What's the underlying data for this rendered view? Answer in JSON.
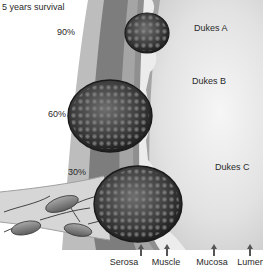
{
  "diagram": {
    "title": "5 years survival",
    "survival_labels": [
      {
        "value": "90%",
        "stage": "Dukes A"
      },
      {
        "value": "60%",
        "stage": "Dukes B"
      },
      {
        "value": "30%",
        "stage": "Dukes C"
      }
    ],
    "layers": [
      {
        "label": "Serosa",
        "icon": "arrow-up-icon"
      },
      {
        "label": "Muscle",
        "icon": "arrow-up-icon"
      },
      {
        "label": "Mucosa",
        "icon": "arrow-up-icon"
      },
      {
        "label": "Lumen",
        "icon": "arrow-up-icon"
      }
    ],
    "colors": {
      "serosa": "#b8b8b8",
      "muscle": "#7a7a7a",
      "mucosa_band": "#9a9a9a",
      "mucosa": "#e9e9e9",
      "lumen": "#d9d9d9",
      "tumor": "#3a3a3a",
      "lymph": "#8a8a8a"
    }
  }
}
